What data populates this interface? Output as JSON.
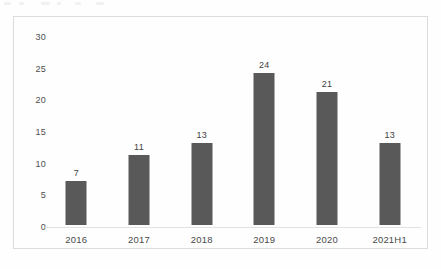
{
  "chart_data": {
    "type": "bar",
    "title": "",
    "subtitle": "",
    "xlabel": "",
    "ylabel": "",
    "categories": [
      "2016",
      "2017",
      "2018",
      "2019",
      "2020",
      "2021H1"
    ],
    "values": [
      7,
      11,
      13,
      24,
      21,
      13
    ],
    "data_labels": [
      "7",
      "11",
      "13",
      "24",
      "21",
      "13"
    ],
    "ylim": [
      0,
      30
    ],
    "yticks": [
      0,
      5,
      10,
      15,
      20,
      25,
      30
    ],
    "ytick_labels": [
      "0",
      "5",
      "10",
      "15",
      "20",
      "25",
      "30"
    ],
    "grid": false,
    "legend": null,
    "bar_color": "#595959",
    "axis_color": "#e2e2e2",
    "border_color": "#dcdcdc",
    "label_color": "#4a4a4a",
    "background_color": "#fefefe"
  }
}
